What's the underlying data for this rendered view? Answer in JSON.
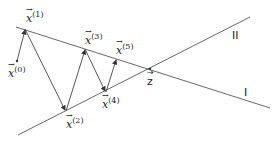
{
  "diagram": {
    "lines": [
      {
        "name": "I",
        "label": "I",
        "from": [
          16,
          27
        ],
        "to": [
          270,
          108
        ]
      },
      {
        "name": "II",
        "label": "II",
        "from": [
          18,
          135
        ],
        "to": [
          250,
          17
        ]
      }
    ],
    "intersection": {
      "label": "z",
      "point": [
        150,
        69
      ]
    },
    "points": [
      {
        "label": "x",
        "index": "(0)",
        "xy": [
          17,
          61
        ]
      },
      {
        "label": "x",
        "index": "(1)",
        "xy": [
          25,
          29
        ]
      },
      {
        "label": "x",
        "index": "(2)",
        "xy": [
          66,
          111
        ]
      },
      {
        "label": "x",
        "index": "(3)",
        "xy": [
          85,
          49
        ]
      },
      {
        "label": "x",
        "index": "(4)",
        "xy": [
          106,
          92
        ]
      },
      {
        "label": "x",
        "index": "(5)",
        "xy": [
          116,
          59
        ]
      }
    ],
    "colors": {
      "line": "#444444",
      "text": "#222222"
    }
  }
}
